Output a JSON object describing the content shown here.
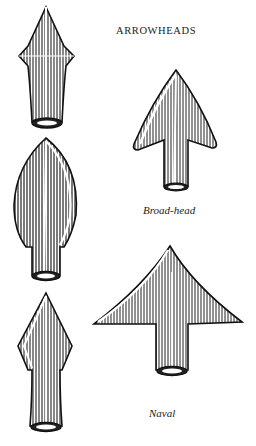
{
  "plate": {
    "title": "ARROWHEADS",
    "figures": [
      {
        "id": "unlabeled-1",
        "caption": "",
        "shape": "bodkin-point"
      },
      {
        "id": "unlabeled-2",
        "caption": "",
        "shape": "leaf-blade"
      },
      {
        "id": "unlabeled-3",
        "caption": "",
        "shape": "diamond-blade"
      },
      {
        "id": "broad-head",
        "caption": "Broad-head",
        "shape": "barbed-broadhead"
      },
      {
        "id": "naval",
        "caption": "Naval",
        "shape": "wide-barbed-naval"
      }
    ]
  },
  "colors": {
    "ink": "#1a1a1a",
    "paper": "#ffffff",
    "shade": "#555555"
  }
}
